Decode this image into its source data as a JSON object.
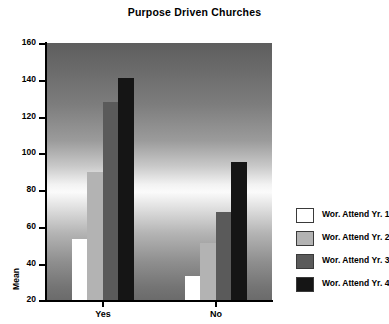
{
  "chart_data": {
    "type": "bar",
    "title": "Purpose Driven Churches",
    "xlabel": "",
    "ylabel": "Mean",
    "categories": [
      "Yes",
      "No"
    ],
    "series": [
      {
        "name": "Wor. Attend Yr. 1",
        "values": [
          53,
          33
        ],
        "color": "#ffffff"
      },
      {
        "name": "Wor. Attend Yr. 2",
        "values": [
          90,
          51
        ],
        "color": "#b3b3b3"
      },
      {
        "name": "Wor. Attend Yr. 3",
        "values": [
          128,
          68
        ],
        "color": "#5a5a5a"
      },
      {
        "name": "Wor. Attend Yr. 4",
        "values": [
          141,
          95
        ],
        "color": "#151515"
      }
    ],
    "ylim": [
      20,
      160
    ],
    "yticks": [
      20,
      40,
      60,
      80,
      100,
      120,
      140,
      160
    ],
    "ytick_labels": [
      "20",
      "40",
      "60",
      "80",
      "100",
      "120",
      "140",
      "160"
    ],
    "grid": false,
    "legend_position": "right",
    "plot_background": "vertical grayscale gradient, dark at top and bottom, light band in middle"
  },
  "axis": {
    "y_title": "Mean",
    "tick_0": "20",
    "tick_1": "40",
    "tick_2": "60",
    "tick_3": "80",
    "tick_4": "100",
    "tick_5": "120",
    "tick_6": "140",
    "tick_7": "160",
    "cat_0": "Yes",
    "cat_1": "No"
  },
  "legend": {
    "items": [
      {
        "label": "Wor. Attend Yr. 1"
      },
      {
        "label": "Wor. Attend Yr. 2"
      },
      {
        "label": "Wor. Attend Yr. 3"
      },
      {
        "label": "Wor. Attend Yr. 4"
      }
    ]
  }
}
